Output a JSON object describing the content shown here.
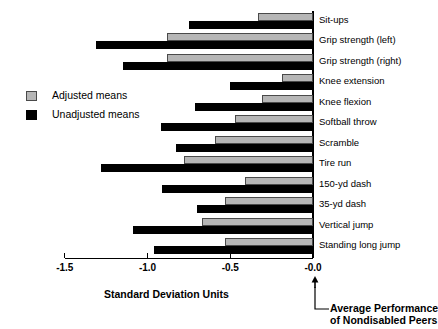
{
  "chart_data": {
    "type": "bar",
    "orientation": "horizontal",
    "title": "",
    "xlabel": "Standard Deviation Units",
    "ylabel": "",
    "xlim": [
      -1.5,
      0.0
    ],
    "xticks": [
      "-1.5",
      "-1.0",
      "-0.5",
      "-0.0"
    ],
    "xtick_values": [
      -1.5,
      -1.0,
      -0.5,
      0.0
    ],
    "grid": false,
    "legend_position": "middle-left",
    "categories": [
      "Sit-ups",
      "Grip strength (left)",
      "Grip strength (right)",
      "Knee extension",
      "Knee flexion",
      "Softball throw",
      "Scramble",
      "Tire run",
      "150-yd dash",
      "35-yd dash",
      "Vertical jump",
      "Standing long jump"
    ],
    "series": [
      {
        "name": "Adjusted means",
        "color": "#b6b6b6",
        "values": [
          -0.33,
          -0.88,
          -0.88,
          -0.19,
          -0.31,
          -0.47,
          -0.59,
          -0.78,
          -0.41,
          -0.53,
          -0.67,
          -0.53
        ]
      },
      {
        "name": "Unadjusted means",
        "color": "#000000",
        "values": [
          -0.75,
          -1.31,
          -1.15,
          -0.5,
          -0.71,
          -0.92,
          -0.83,
          -1.28,
          -0.91,
          -0.7,
          -1.09,
          -0.96
        ]
      }
    ],
    "annotations": [
      {
        "name": "zero-reference",
        "line1": "Average Performance",
        "line2": "of Nondisabled Peers",
        "at_value": 0.0
      }
    ]
  },
  "legend": {
    "items": [
      {
        "label": "Adjusted means",
        "swatch": "gray-square-swatch"
      },
      {
        "label": "Unadjusted means",
        "swatch": "black-square-swatch"
      }
    ]
  }
}
